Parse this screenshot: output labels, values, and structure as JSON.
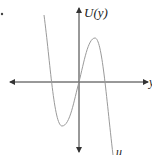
{
  "figure": {
    "type": "cubic-potential-plot",
    "y_axis_label": "U(y)",
    "x_axis_label": "y",
    "curve_label": "u",
    "colors": {
      "axis": "#333333",
      "curve": "#9a9a9a",
      "text": "#222222",
      "background": "#ffffff"
    },
    "curve_shape": {
      "description": "cubic with negative leading coefficient: local minimum left of origin, passes through origin, local maximum right of origin",
      "local_min": "left of y-axis, below x-axis",
      "local_max": "right of y-axis, above x-axis"
    }
  }
}
